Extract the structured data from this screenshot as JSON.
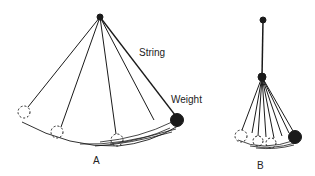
{
  "diagram": {
    "labels": {
      "string": "String",
      "weight": "Weight",
      "panel_a": "A",
      "panel_b": "B"
    },
    "panel_a": {
      "pivot": [
        100,
        17
      ],
      "weight": [
        177,
        120
      ],
      "ghost_positions": [
        [
          24,
          112
        ],
        [
          57,
          132
        ],
        [
          117,
          140
        ],
        [
          155,
          124
        ]
      ]
    },
    "panel_b": {
      "top_pivot": [
        263,
        20
      ],
      "mid_pivot": [
        262,
        77
      ],
      "weight": [
        295,
        136
      ],
      "ghost_positions": [
        [
          241,
          136
        ],
        [
          258,
          141
        ],
        [
          271,
          143
        ]
      ]
    },
    "colors": {
      "ink": "#1a1a1a",
      "background": "#ffffff"
    }
  }
}
